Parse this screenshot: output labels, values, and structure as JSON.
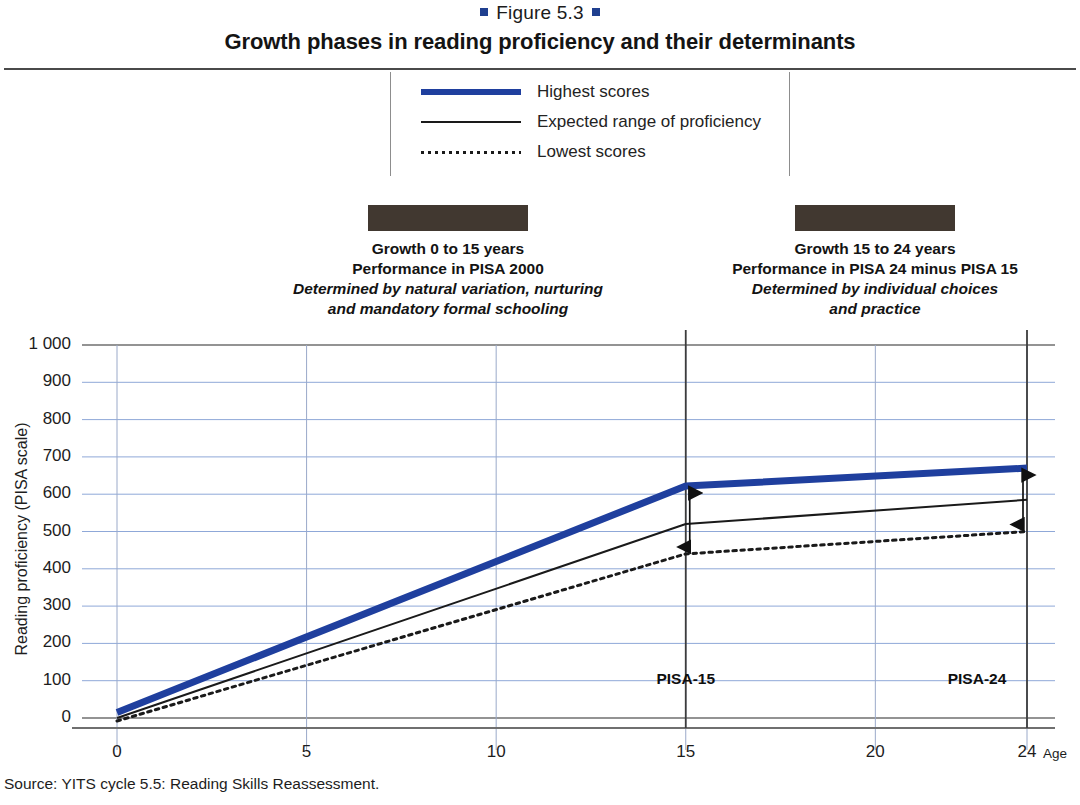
{
  "header": {
    "figure_label": "Figure 5.3",
    "title": "Growth phases in reading proficiency and their determinants"
  },
  "legend": {
    "items": [
      {
        "label": "Highest scores",
        "style": "thick-blue",
        "color": "#1f3f9e"
      },
      {
        "label": "Expected range of proficiency",
        "style": "thin-black",
        "color": "#1a1a1a"
      },
      {
        "label": "Lowest scores",
        "style": "dotted-black",
        "color": "#1a1a1a"
      }
    ]
  },
  "phases": [
    {
      "bar_color": "#413830",
      "line1": "Growth 0 to 15 years",
      "line2": "Performance in PISA 2000",
      "line3": "Determined by natural variation, nurturing",
      "line4": "and mandatory formal schooling"
    },
    {
      "bar_color": "#413830",
      "line1": "Growth 15 to 24 years",
      "line2": "Performance in PISA 24 minus PISA 15",
      "line3": "Determined by individual choices",
      "line4": "and practice"
    }
  ],
  "markers": {
    "pisa15": "PISA-15",
    "pisa24": "PISA-24"
  },
  "source": "Source: YITS cycle 5.5: Reading Skills Reassessment.",
  "chart_data": {
    "type": "line",
    "title": "Growth phases in reading proficiency and their determinants",
    "xlabel": "Age",
    "ylabel": "Reading proficiency (PISA scale)",
    "xlim": [
      0,
      24
    ],
    "ylim": [
      0,
      1000
    ],
    "xticks": [
      0,
      5,
      10,
      15,
      20,
      24
    ],
    "xticklabels": [
      "0",
      "5",
      "10",
      "15",
      "20",
      "24"
    ],
    "yticks": [
      0,
      100,
      200,
      300,
      400,
      500,
      600,
      700,
      800,
      900,
      1000
    ],
    "yticklabels": [
      "0",
      "100",
      "200",
      "300",
      "400",
      "500",
      "600",
      "700",
      "800",
      "900",
      "1 000"
    ],
    "grid": true,
    "grid_color": "#8fa8d8",
    "legend_position": "top-center",
    "series": [
      {
        "name": "Highest scores",
        "color": "#1f3f9e",
        "linestyle": "solid",
        "linewidth": 7,
        "x": [
          0,
          15,
          24
        ],
        "y": [
          15,
          622,
          670
        ]
      },
      {
        "name": "Expected range of proficiency",
        "color": "#1a1a1a",
        "linestyle": "solid",
        "linewidth": 2,
        "x": [
          0,
          15,
          24
        ],
        "y": [
          0,
          520,
          585
        ]
      },
      {
        "name": "Lowest scores",
        "color": "#1a1a1a",
        "linestyle": "dotted",
        "linewidth": 3,
        "x": [
          0,
          15,
          24
        ],
        "y": [
          -8,
          440,
          500
        ]
      }
    ],
    "annotations": [
      {
        "type": "vline",
        "x": 15,
        "label": "PISA-15",
        "color": "#4a4a4a"
      },
      {
        "type": "vline",
        "x": 24,
        "label": "PISA-24",
        "color": "#4a4a4a"
      },
      {
        "type": "double-arrow",
        "x": 15,
        "y_from": 440,
        "y_to": 622
      },
      {
        "type": "double-arrow",
        "x": 24,
        "y_from": 500,
        "y_to": 670
      }
    ]
  }
}
